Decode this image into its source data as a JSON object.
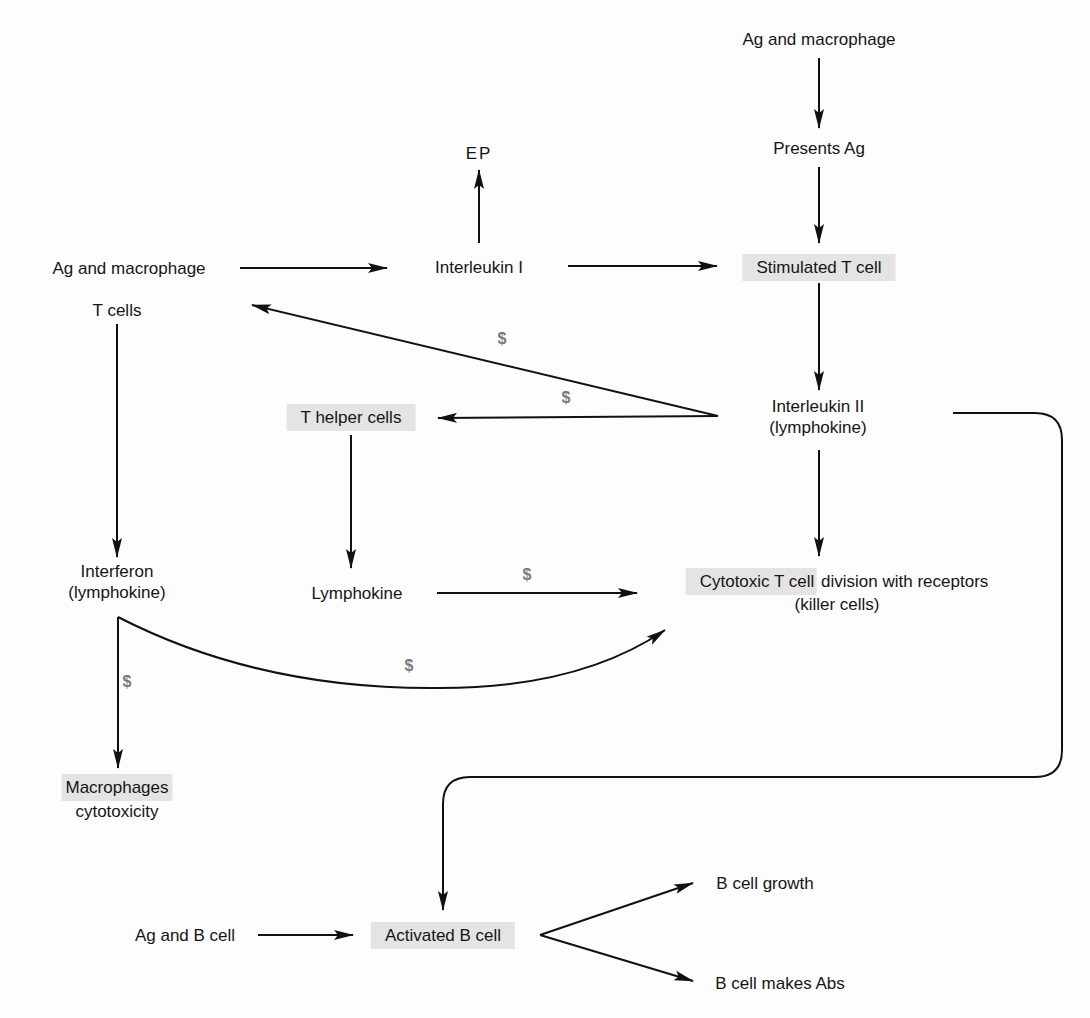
{
  "colors": {
    "background": "#fdfdfd",
    "text": "#151515",
    "line": "#111111",
    "highlight": "#e4e4e4",
    "dollar": "#7a7a7a"
  },
  "nodes": {
    "ag_macrophage_top": "Ag and macrophage",
    "presents_ag": "Presents Ag",
    "stimulated_t_cell": "Stimulated T cell",
    "ep": "EP",
    "interleukin_1": "Interleukin I",
    "ag_macrophage_left": "Ag and macrophage",
    "t_cells": "T cells",
    "t_helper_cells": "T helper cells",
    "interleukin_2_line1": "Interleukin II",
    "interleukin_2_line2": "(lymphokine)",
    "interferon_line1": "Interferon",
    "interferon_line2": "(lymphokine)",
    "lymphokine": "Lymphokine",
    "cytotoxic_highlight": "Cytotoxic T cell",
    "cytotoxic_rest": " division with receptors",
    "cytotoxic_line2": "(killer cells)",
    "macrophages_line1": "Macrophages",
    "macrophages_line2": "cytotoxicity",
    "ag_b_cell": "Ag and B cell",
    "activated_b_cell": "Activated B cell",
    "b_cell_growth": "B cell growth",
    "b_cell_makes_abs": "B cell makes Abs"
  },
  "markers": {
    "il2_to_ag": "$",
    "il2_to_thelper": "$",
    "lymphokine_to_cytotoxic": "$",
    "interferon_to_cytotoxic": "$",
    "interferon_to_macrophages": "$"
  },
  "edges": [
    {
      "from": "Ag and macrophage (top)",
      "to": "Presents Ag"
    },
    {
      "from": "Presents Ag",
      "to": "Stimulated T cell"
    },
    {
      "from": "Ag and macrophage (left)",
      "to": "Interleukin I"
    },
    {
      "from": "Interleukin I",
      "to": "EP"
    },
    {
      "from": "Interleukin I",
      "to": "Stimulated T cell"
    },
    {
      "from": "Stimulated T cell",
      "to": "Interleukin II"
    },
    {
      "from": "Interleukin II",
      "to": "T cells",
      "label": "$"
    },
    {
      "from": "Interleukin II",
      "to": "T helper cells",
      "label": "$"
    },
    {
      "from": "Interleukin II",
      "to": "Cytotoxic T cell"
    },
    {
      "from": "Interleukin II",
      "to": "Activated B cell"
    },
    {
      "from": "T cells",
      "to": "Interferon"
    },
    {
      "from": "T helper cells",
      "to": "Lymphokine"
    },
    {
      "from": "Lymphokine",
      "to": "Cytotoxic T cell",
      "label": "$"
    },
    {
      "from": "Interferon",
      "to": "Cytotoxic T cell",
      "label": "$"
    },
    {
      "from": "Interferon",
      "to": "Macrophages cytotoxicity",
      "label": "$"
    },
    {
      "from": "Ag and B cell",
      "to": "Activated B cell"
    },
    {
      "from": "Activated B cell",
      "to": "B cell growth"
    },
    {
      "from": "Activated B cell",
      "to": "B cell makes Abs"
    }
  ]
}
